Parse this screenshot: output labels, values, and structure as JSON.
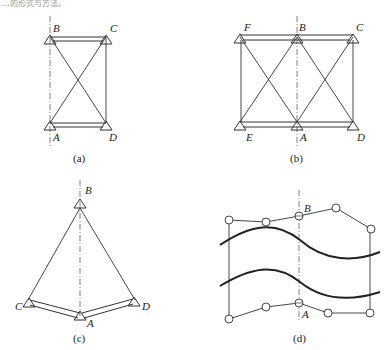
{
  "header_fragment": "…的形式与方法。",
  "panels": {
    "a": {
      "caption": "(a)",
      "points": {
        "B": "B",
        "C": "C",
        "A": "A",
        "D": "D"
      }
    },
    "b": {
      "caption": "(b)",
      "points": {
        "F": "F",
        "B": "B",
        "C": "C",
        "E": "E",
        "A": "A",
        "D": "D"
      }
    },
    "c": {
      "caption": "(c)",
      "points": {
        "B": "B",
        "C": "C",
        "A": "A",
        "D": "D"
      }
    },
    "d": {
      "caption": "(d)",
      "points": {
        "B": "B",
        "A": "A"
      }
    }
  },
  "colors": {
    "line": "#333333",
    "axis": "#666666",
    "background": "#ffffff"
  }
}
